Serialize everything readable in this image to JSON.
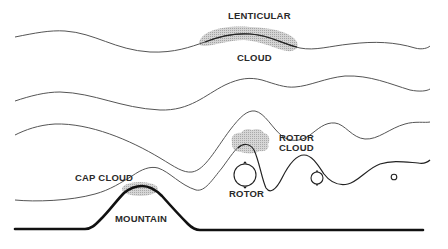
{
  "diagram": {
    "labels": {
      "lenticular_line1": "LENTICULAR",
      "lenticular_line2": "CLOUD",
      "rotor_cloud_line1": "ROTOR",
      "rotor_cloud_line2": "CLOUD",
      "cap_cloud": "CAP CLOUD",
      "rotor": "ROTOR",
      "mountain": "MOUNTAIN"
    },
    "elements": [
      {
        "name": "lenticular-cloud",
        "type": "shaded-cloud"
      },
      {
        "name": "rotor-cloud",
        "type": "shaded-cloud"
      },
      {
        "name": "cap-cloud",
        "type": "shaded-cloud"
      },
      {
        "name": "rotor-large",
        "type": "circulation"
      },
      {
        "name": "rotor-medium",
        "type": "circulation"
      },
      {
        "name": "rotor-small",
        "type": "circulation"
      },
      {
        "name": "mountain",
        "type": "terrain"
      },
      {
        "name": "airflow-streamlines",
        "count": 4
      }
    ],
    "colors": {
      "background": "#ffffff",
      "line": "#555555",
      "terrain": "#111111",
      "cloud_shade": "#b8b8b8",
      "text": "#2a2a2a"
    }
  }
}
